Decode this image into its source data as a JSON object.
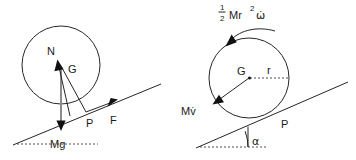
{
  "figure": {
    "background_color": "#ffffff",
    "line_color": "#262626",
    "grey_color": "#8c8c8c"
  },
  "left_panel": {
    "name": "free-body-diagram",
    "circle": {
      "cx": 61,
      "cy": 65,
      "r": 39
    },
    "labels": {
      "normal_force": "N",
      "center": "G",
      "contact_point": "P",
      "friction_force": "F",
      "weight": "Mg"
    },
    "incline": {
      "x1": 13,
      "y1": 145,
      "x2": 161,
      "y2": 84
    }
  },
  "right_panel": {
    "name": "kinetic-diagram",
    "circle": {
      "cx": 249,
      "cy": 78,
      "r": 40
    },
    "labels": {
      "angular_term": "Mr",
      "angular_fraction_numerator": "1",
      "angular_fraction_denominator": "2",
      "angular_exponent": "2",
      "angular_omega": "ω̇",
      "linear_term": "Mv̇",
      "center": "G",
      "radius": "r",
      "contact_point": "P",
      "incline_angle": "α"
    },
    "incline": {
      "x1": 196,
      "y1": 148,
      "x2": 348,
      "y2": 82
    }
  }
}
